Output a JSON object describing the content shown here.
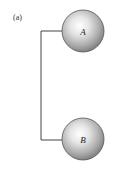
{
  "figure": {
    "panel_label": "(a)",
    "spheres": [
      {
        "id": "A",
        "label": "A"
      },
      {
        "id": "B",
        "label": "B"
      }
    ],
    "connection": "wire connecting A and B"
  }
}
